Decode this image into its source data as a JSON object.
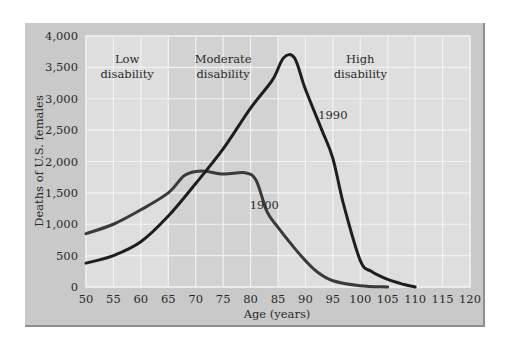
{
  "chart_data": {
    "type": "line",
    "title": "",
    "xlabel": "Age (years)",
    "ylabel": "Deaths of U.S. females",
    "xlim": [
      50,
      120
    ],
    "ylim": [
      0,
      4000
    ],
    "x_ticks": [
      50,
      55,
      60,
      65,
      70,
      75,
      80,
      85,
      90,
      95,
      100,
      105,
      110,
      115,
      120
    ],
    "y_ticks": [
      0,
      500,
      1000,
      1500,
      2000,
      2500,
      3000,
      3500,
      4000
    ],
    "y_tick_labels": [
      "0",
      "500",
      "1,000",
      "1,500",
      "2,000",
      "2,500",
      "3,000",
      "3,500",
      "4,000"
    ],
    "grid": true,
    "regions": [
      {
        "label_line1": "Low",
        "label_line2": "disability",
        "from": 50,
        "to": 65,
        "shade": "#dedede"
      },
      {
        "label_line1": "Moderate",
        "label_line2": "disability",
        "from": 65,
        "to": 85,
        "shade": "#d2d2d2"
      },
      {
        "label_line1": "High",
        "label_line2": "disability",
        "from": 85,
        "to": 120,
        "shade": "#dedede"
      }
    ],
    "series": [
      {
        "name": "1900",
        "x": [
          50,
          55,
          60,
          65,
          68,
          71,
          75,
          79,
          81,
          83,
          85,
          88,
          90,
          92,
          95,
          100,
          105
        ],
        "values": [
          850,
          1000,
          1230,
          1500,
          1780,
          1850,
          1800,
          1820,
          1700,
          1200,
          950,
          620,
          420,
          250,
          100,
          20,
          0
        ],
        "label_pos": {
          "x": 82.5,
          "y": 1250
        }
      },
      {
        "name": "1990",
        "x": [
          50,
          55,
          60,
          65,
          70,
          75,
          80,
          84,
          86,
          88,
          90,
          93,
          95,
          97,
          100,
          102,
          105,
          108,
          110
        ],
        "values": [
          380,
          500,
          720,
          1130,
          1650,
          2200,
          2850,
          3300,
          3650,
          3650,
          3150,
          2500,
          2050,
          1300,
          420,
          250,
          120,
          40,
          0
        ],
        "label_pos": {
          "x": 95,
          "y": 2680
        }
      }
    ]
  }
}
